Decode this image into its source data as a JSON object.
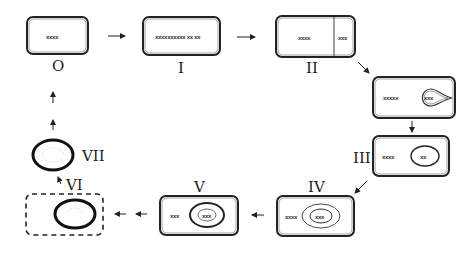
{
  "diagram": {
    "type": "cycle",
    "stages": [
      {
        "id": "0",
        "numeral": "O",
        "label": "stage-0",
        "inner_text": "xxxx"
      },
      {
        "id": "1",
        "numeral": "I",
        "label": "stage-1",
        "inner_text": "xxxxxxxxxx xx xx"
      },
      {
        "id": "2",
        "numeral": "II",
        "label": "stage-2",
        "inner_text": "xxxx",
        "side_text": "xxx"
      },
      {
        "id": "2b",
        "numeral": "",
        "label": "stage-2b",
        "inner_text": "xxxxx",
        "nucleus_text": "xxx"
      },
      {
        "id": "3",
        "numeral": "III",
        "label": "stage-3",
        "inner_text": "xxxx",
        "nucleus_text": "xx"
      },
      {
        "id": "4",
        "numeral": "IV",
        "label": "stage-4",
        "inner_text": "xxxx",
        "nucleus_text": "xxx"
      },
      {
        "id": "5",
        "numeral": "V",
        "label": "stage-5",
        "inner_text": "xxx",
        "nucleus_text": "xxx"
      },
      {
        "id": "6",
        "numeral": "VI",
        "label": "stage-6"
      },
      {
        "id": "7",
        "numeral": "VII",
        "label": "stage-7"
      }
    ],
    "colors": {
      "stroke": "#222222",
      "background": "#ffffff"
    }
  }
}
